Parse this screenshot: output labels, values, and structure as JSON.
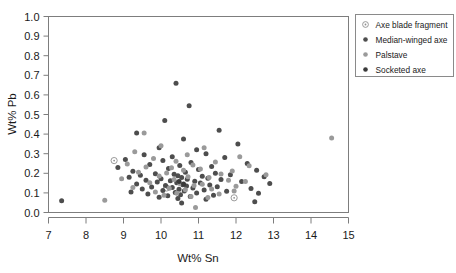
{
  "chart_data": {
    "type": "scatter",
    "title": "",
    "xlabel": "Wt% Sn",
    "ylabel": "Wt% Pb",
    "xlim": [
      7,
      15
    ],
    "ylim": [
      0.0,
      1.0
    ],
    "xticks": [
      7,
      8,
      9,
      10,
      11,
      12,
      13,
      14,
      15
    ],
    "xtick_labels": [
      "7",
      "8",
      "9",
      "10",
      "11",
      "12",
      "13",
      "14",
      "15"
    ],
    "yticks": [
      0.0,
      0.1,
      0.2,
      0.3,
      0.4,
      0.5,
      0.6,
      0.7,
      0.8,
      0.9,
      1.0
    ],
    "ytick_labels": [
      "0.0",
      "0.1",
      "0.2",
      "0.3",
      "0.4",
      "0.5",
      "0.6",
      "0.7",
      "0.8",
      "0.9",
      "1.0"
    ],
    "grid": false,
    "legend_position": "top-right",
    "colors": {
      "dark_gray": "#4d4d4d",
      "light_gray": "#9a9a9a",
      "open_circle": "#8f8f8f",
      "axis": "#7d7d7d",
      "text": "#1a1a1a",
      "background": "#ffffff"
    },
    "series": [
      {
        "name": "Axe blade fragment",
        "marker": "open-circle-dot",
        "color": "#8f8f8f",
        "points": [
          [
            8.75,
            0.265
          ],
          [
            10.15,
            0.125
          ],
          [
            11.95,
            0.075
          ]
        ]
      },
      {
        "name": "Median-winged axe",
        "marker": "filled-circle",
        "color": "#4d4d4d",
        "points": [
          [
            10.4,
            0.66
          ],
          [
            10.75,
            0.545
          ],
          [
            10.1,
            0.47
          ],
          [
            11.55,
            0.42
          ],
          [
            9.35,
            0.405
          ],
          [
            10.6,
            0.375
          ],
          [
            12.05,
            0.35
          ],
          [
            9.95,
            0.33
          ],
          [
            10.95,
            0.32
          ],
          [
            11.2,
            0.3
          ],
          [
            9.55,
            0.295
          ],
          [
            10.3,
            0.285
          ],
          [
            11.7,
            0.28
          ],
          [
            9.05,
            0.27
          ],
          [
            10.05,
            0.265
          ],
          [
            10.8,
            0.255
          ],
          [
            12.3,
            0.25
          ],
          [
            9.7,
            0.245
          ],
          [
            10.5,
            0.24
          ],
          [
            11.35,
            0.235
          ],
          [
            8.85,
            0.23
          ],
          [
            10.2,
            0.225
          ],
          [
            11.0,
            0.22
          ],
          [
            12.55,
            0.215
          ],
          [
            9.25,
            0.21
          ],
          [
            10.65,
            0.205
          ],
          [
            11.45,
            0.2
          ],
          [
            9.85,
            0.198
          ],
          [
            10.35,
            0.195
          ],
          [
            11.85,
            0.192
          ],
          [
            9.45,
            0.19
          ],
          [
            10.45,
            0.188
          ],
          [
            11.1,
            0.185
          ],
          [
            12.75,
            0.182
          ],
          [
            9.15,
            0.18
          ],
          [
            10.55,
            0.178
          ],
          [
            11.25,
            0.175
          ],
          [
            10.0,
            0.172
          ],
          [
            10.7,
            0.17
          ],
          [
            11.6,
            0.168
          ],
          [
            9.6,
            0.165
          ],
          [
            10.25,
            0.162
          ],
          [
            10.9,
            0.16
          ],
          [
            12.15,
            0.158
          ],
          [
            9.9,
            0.155
          ],
          [
            10.42,
            0.152
          ],
          [
            11.05,
            0.15
          ],
          [
            12.9,
            0.148
          ],
          [
            9.35,
            0.145
          ],
          [
            10.58,
            0.142
          ],
          [
            11.3,
            0.14
          ],
          [
            10.12,
            0.138
          ],
          [
            10.68,
            0.135
          ],
          [
            11.5,
            0.132
          ],
          [
            9.75,
            0.13
          ],
          [
            10.3,
            0.128
          ],
          [
            10.85,
            0.125
          ],
          [
            12.4,
            0.122
          ],
          [
            9.5,
            0.12
          ],
          [
            10.48,
            0.118
          ],
          [
            11.15,
            0.115
          ],
          [
            10.05,
            0.112
          ],
          [
            10.62,
            0.11
          ],
          [
            11.75,
            0.108
          ],
          [
            9.2,
            0.105
          ],
          [
            10.38,
            0.102
          ],
          [
            10.95,
            0.1
          ],
          [
            12.6,
            0.098
          ],
          [
            7.35,
            0.06
          ],
          [
            9.65,
            0.095
          ],
          [
            10.52,
            0.09
          ],
          [
            11.4,
            0.088
          ],
          [
            10.18,
            0.085
          ],
          [
            10.78,
            0.082
          ],
          [
            9.95,
            0.078
          ],
          [
            10.45,
            0.072
          ],
          [
            11.2,
            0.068
          ],
          [
            12.5,
            0.055
          ],
          [
            10.55,
            0.048
          ]
        ]
      },
      {
        "name": "Palstave",
        "marker": "filled-circle",
        "color": "#9a9a9a",
        "points": [
          [
            14.55,
            0.38
          ],
          [
            9.55,
            0.405
          ],
          [
            10.0,
            0.34
          ],
          [
            11.15,
            0.33
          ],
          [
            9.3,
            0.31
          ],
          [
            10.7,
            0.295
          ],
          [
            12.1,
            0.285
          ],
          [
            9.8,
            0.275
          ],
          [
            10.4,
            0.262
          ],
          [
            11.45,
            0.258
          ],
          [
            9.1,
            0.248
          ],
          [
            10.85,
            0.242
          ],
          [
            12.35,
            0.238
          ],
          [
            9.6,
            0.232
          ],
          [
            10.28,
            0.228
          ],
          [
            11.05,
            0.222
          ],
          [
            10.6,
            0.215
          ],
          [
            11.9,
            0.212
          ],
          [
            9.4,
            0.205
          ],
          [
            10.15,
            0.202
          ],
          [
            11.6,
            0.196
          ],
          [
            12.8,
            0.192
          ],
          [
            9.95,
            0.186
          ],
          [
            10.72,
            0.182
          ],
          [
            11.28,
            0.178
          ],
          [
            8.95,
            0.172
          ],
          [
            10.35,
            0.168
          ],
          [
            11.8,
            0.164
          ],
          [
            12.25,
            0.158
          ],
          [
            9.7,
            0.152
          ],
          [
            10.5,
            0.148
          ],
          [
            11.1,
            0.144
          ],
          [
            10.88,
            0.138
          ],
          [
            12.0,
            0.134
          ],
          [
            9.25,
            0.128
          ],
          [
            10.22,
            0.124
          ],
          [
            11.35,
            0.12
          ],
          [
            10.65,
            0.116
          ],
          [
            11.95,
            0.11
          ],
          [
            8.5,
            0.062
          ],
          [
            9.85,
            0.104
          ],
          [
            10.42,
            0.098
          ],
          [
            11.55,
            0.094
          ],
          [
            10.08,
            0.088
          ],
          [
            10.8,
            0.082
          ],
          [
            11.25,
            0.076
          ],
          [
            10.92,
            0.025
          ]
        ]
      },
      {
        "name": "Socketed axe",
        "marker": "filled-circle",
        "color": "#3a3a3a",
        "points": [
          [
            10.48,
            0.158
          ],
          [
            10.6,
            0.146
          ]
        ]
      }
    ]
  },
  "legend": {
    "entries": [
      {
        "label": "Axe blade fragment",
        "marker": "open-circle-dot",
        "color": "#8f8f8f"
      },
      {
        "label": "Median-winged axe",
        "marker": "filled-circle",
        "color": "#4d4d4d"
      },
      {
        "label": "Palstave",
        "marker": "filled-circle",
        "color": "#9a9a9a"
      },
      {
        "label": "Socketed axe",
        "marker": "filled-circle",
        "color": "#3a3a3a"
      }
    ]
  }
}
